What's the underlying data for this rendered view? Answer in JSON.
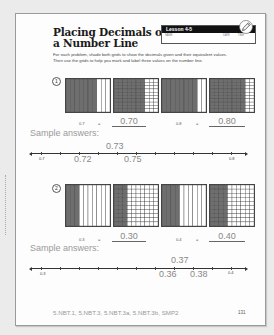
{
  "title": {
    "line1": "Placing Decimals on",
    "line2": "a Number Line"
  },
  "lesson": {
    "label": "Lesson 4-5",
    "fields": [
      "NAME",
      "DATE",
      "TIME"
    ],
    "icon": "pencil-icon"
  },
  "instructions": {
    "line1": "For each problem, shade both grids to show the decimals given and their equivalent values.",
    "line2": "Then use the grids to help you mark and label three values on the number line."
  },
  "problems": [
    {
      "number": "1",
      "grids": [
        {
          "type": "tenths",
          "shaded": 7
        },
        {
          "type": "hundredths",
          "shaded": 70
        },
        {
          "type": "tenths",
          "shaded": 8
        },
        {
          "type": "hundredths",
          "shaded": 80
        }
      ],
      "equations": [
        {
          "given": "0.7",
          "equals": "=",
          "answer": "0.70"
        },
        {
          "given": "0.8",
          "equals": "=",
          "answer": "0.80"
        }
      ],
      "sample_label": "Sample answers:",
      "number_line": {
        "start": "0.7",
        "end": "0.8",
        "above": "0.73",
        "below": [
          "0.72",
          "0.75"
        ]
      }
    },
    {
      "number": "2",
      "grids": [
        {
          "type": "tenths",
          "shaded": 3
        },
        {
          "type": "hundredths",
          "shaded": 30
        },
        {
          "type": "tenths",
          "shaded": 4
        },
        {
          "type": "hundredths",
          "shaded": 40
        }
      ],
      "equations": [
        {
          "given": "0.3",
          "equals": "=",
          "answer": "0.30"
        },
        {
          "given": "0.4",
          "equals": "=",
          "answer": "0.40"
        }
      ],
      "sample_label": "Sample answers:",
      "number_line": {
        "start": "0.3",
        "end": "0.4",
        "above": "0.37",
        "below": [
          "0.36",
          "0.38"
        ]
      }
    }
  ],
  "footer": {
    "standards": "5.NBT.1, 5.NBT.3, 5.NBT.3a, 5.NBT.3b, SMP2",
    "page_number": "131"
  },
  "colors": {
    "shade": "#6e6e6e",
    "grid_line": "#444444",
    "answer_text": "#888888"
  }
}
